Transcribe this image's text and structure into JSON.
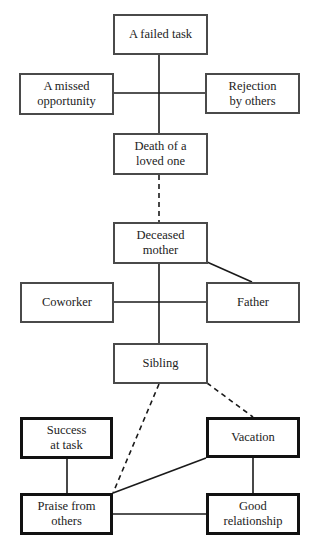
{
  "nodes": [
    {
      "id": "failed-task",
      "label": "A failed task",
      "x": 113,
      "y": 14,
      "w": 95,
      "h": 41,
      "style": "gray"
    },
    {
      "id": "missed-opportunity",
      "label": "A missed\nopportunity",
      "x": 19,
      "y": 73,
      "w": 95,
      "h": 42,
      "style": "gray"
    },
    {
      "id": "rejection",
      "label": "Rejection\nby others",
      "x": 205,
      "y": 73,
      "w": 95,
      "h": 41,
      "style": "gray"
    },
    {
      "id": "death",
      "label": "Death of a\nloved one",
      "x": 113,
      "y": 133,
      "w": 95,
      "h": 42,
      "style": "gray"
    },
    {
      "id": "deceased-mother",
      "label": "Deceased\nmother",
      "x": 113,
      "y": 222,
      "w": 95,
      "h": 42,
      "style": "gray"
    },
    {
      "id": "coworker",
      "label": "Coworker",
      "x": 20,
      "y": 282,
      "w": 94,
      "h": 41,
      "style": "gray"
    },
    {
      "id": "father",
      "label": "Father",
      "x": 206,
      "y": 282,
      "w": 94,
      "h": 41,
      "style": "gray"
    },
    {
      "id": "sibling",
      "label": "Sibling",
      "x": 113,
      "y": 343,
      "w": 95,
      "h": 41,
      "style": "gray"
    },
    {
      "id": "success",
      "label": "Success\nat task",
      "x": 20,
      "y": 417,
      "w": 93,
      "h": 42,
      "style": "dark"
    },
    {
      "id": "vacation",
      "label": "Vacation",
      "x": 206,
      "y": 417,
      "w": 94,
      "h": 41,
      "style": "dark"
    },
    {
      "id": "praise",
      "label": "Praise from\nothers",
      "x": 20,
      "y": 493,
      "w": 93,
      "h": 42,
      "style": "dark"
    },
    {
      "id": "good-relationship",
      "label": "Good\nrelationship",
      "x": 206,
      "y": 493,
      "w": 94,
      "h": 42,
      "style": "dark"
    }
  ],
  "edges": [
    {
      "from": "failed-task",
      "to": "death",
      "x1": 159,
      "y1": 55,
      "x2": 159,
      "y2": 133,
      "dashed": false
    },
    {
      "from": "missed-opportunity",
      "to": "rejection",
      "x1": 114,
      "y1": 93,
      "x2": 205,
      "y2": 93,
      "dashed": false
    },
    {
      "from": "death",
      "to": "deceased-mother",
      "x1": 159,
      "y1": 175,
      "x2": 159,
      "y2": 222,
      "dashed": true
    },
    {
      "from": "deceased-mother",
      "to": "sibling",
      "x1": 159,
      "y1": 264,
      "x2": 159,
      "y2": 343,
      "dashed": false
    },
    {
      "from": "coworker",
      "to": "father",
      "x1": 114,
      "y1": 302,
      "x2": 206,
      "y2": 302,
      "dashed": false
    },
    {
      "from": "deceased-mother",
      "to": "father",
      "x1": 207,
      "y1": 262,
      "x2": 252,
      "y2": 282,
      "dashed": false
    },
    {
      "from": "sibling",
      "to": "praise",
      "x1": 159,
      "y1": 384,
      "x2": 113,
      "y2": 493,
      "dashed": true
    },
    {
      "from": "sibling",
      "to": "vacation",
      "x1": 207,
      "y1": 383,
      "x2": 253,
      "y2": 417,
      "dashed": true
    },
    {
      "from": "success",
      "to": "praise",
      "x1": 67,
      "y1": 459,
      "x2": 67,
      "y2": 493,
      "dashed": false
    },
    {
      "from": "vacation",
      "to": "good-relationship",
      "x1": 253,
      "y1": 458,
      "x2": 253,
      "y2": 493,
      "dashed": false
    },
    {
      "from": "praise",
      "to": "vacation",
      "x1": 113,
      "y1": 493,
      "x2": 206,
      "y2": 458,
      "dashed": false
    },
    {
      "from": "praise",
      "to": "good-relationship",
      "x1": 113,
      "y1": 514,
      "x2": 206,
      "y2": 514,
      "dashed": false
    }
  ],
  "colors": {
    "line": "#1a1a1a",
    "gray_border": "#4a4a4a",
    "dark_border": "#111111",
    "text": "#222222",
    "background": "#ffffff"
  }
}
